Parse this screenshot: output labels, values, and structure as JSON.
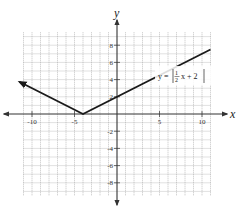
{
  "chart_data": {
    "type": "line",
    "title": "",
    "xlabel": "x",
    "ylabel": "y",
    "xlim": [
      -11,
      11
    ],
    "ylim": [
      -9.5,
      9.5
    ],
    "grid": true,
    "grid_step": 1,
    "x_ticks": [
      -10,
      -5,
      5,
      10
    ],
    "x_tick_labels": [
      "-10",
      "-5",
      "5",
      "10"
    ],
    "y_ticks": [
      8,
      6,
      4,
      2,
      -2,
      -4,
      -6,
      -8
    ],
    "y_tick_labels": [
      "8",
      "6",
      "4",
      "2",
      "-2",
      "-4",
      "-6",
      "-8"
    ],
    "series": [
      {
        "name": "y = |1/2 x + 2|",
        "function": "abs(0.5*x + 2)",
        "x": [
          -11.5,
          -4,
          11
        ],
        "y": [
          3.75,
          0,
          7.5
        ],
        "vertex": [
          -4,
          0
        ],
        "left_arrow": true,
        "right_arrow": false
      }
    ],
    "annotations": [
      {
        "text": "y = |½x + 2|",
        "x": 6.5,
        "y": 3.3
      }
    ]
  },
  "labels": {
    "x_axis": "x",
    "y_axis": "y",
    "equation_prefix": "y =",
    "equation_num": "1",
    "equation_den": "2",
    "equation_suffix": "x + 2"
  }
}
